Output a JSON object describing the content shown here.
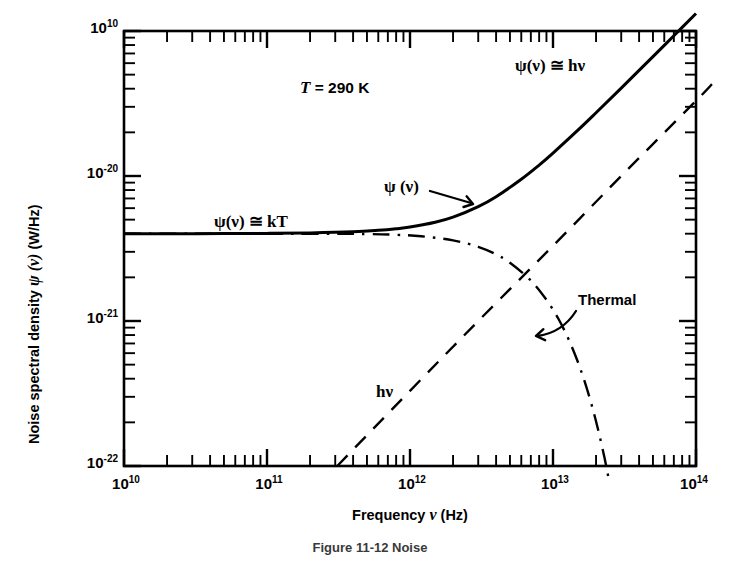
{
  "figure": {
    "caption": "Figure 11-12   Noise is the fewer-... and ...",
    "caption_visible_fragment": "Figure 11-12   Noise"
  },
  "chart_data": {
    "type": "line",
    "title": "",
    "xlabel_text": "Frequency ",
    "xlabel_symbol": "ν",
    "xlabel_units": " (Hz)",
    "ylabel_text": "Noise spectral density ",
    "ylabel_symbol": "ψ (ν)",
    "ylabel_units": " (W/Hz)",
    "xscale": "log",
    "yscale": "log",
    "xlim": [
      10000000000.0,
      100000000000000.0
    ],
    "ylim": [
      1e-22,
      1e-19
    ],
    "xticks": [
      "10^10",
      "10^11",
      "10^12",
      "10^13",
      "10^14"
    ],
    "xtick_mantissas": [
      1,
      10,
      11,
      12,
      13,
      14
    ],
    "yticks": [
      "10^-19",
      "10^-20",
      "10^-21",
      "10^-22"
    ],
    "grid": false,
    "legend": "none",
    "ytick_labels": [
      {
        "mantissa": "10",
        "exponent": "10",
        "value": 1e-19
      },
      {
        "mantissa": "10",
        "exponent": "-20",
        "value": 1e-20
      },
      {
        "mantissa": "10",
        "exponent": "-21",
        "value": 1e-21
      },
      {
        "mantissa": "10",
        "exponent": "-22",
        "value": 1e-22
      }
    ],
    "xtick_labels": [
      {
        "mantissa": "10",
        "exponent": "10",
        "value": 10000000000.0
      },
      {
        "mantissa": "10",
        "exponent": "11",
        "value": 100000000000.0
      },
      {
        "mantissa": "10",
        "exponent": "12",
        "value": 1000000000000.0
      },
      {
        "mantissa": "10",
        "exponent": "13",
        "value": 10000000000000.0
      },
      {
        "mantissa": "10",
        "exponent": "14",
        "value": 100000000000000.0
      }
    ],
    "physics": {
      "temperature_K": 290,
      "kT_W_per_Hz": 4e-21,
      "h_Js": 6.626e-34
    },
    "series": [
      {
        "name": "psi(nu) total",
        "style": "solid",
        "linewidth": 3.0,
        "description": "Total noise spectral density: flat at kT at low frequency, rising as h*nu at high frequency",
        "points": [
          [
            10000000000.0,
            4e-21
          ],
          [
            20000000000.0,
            4e-21
          ],
          [
            50000000000.0,
            4.01e-21
          ],
          [
            100000000000.0,
            4.02e-21
          ],
          [
            200000000000.0,
            4.05e-21
          ],
          [
            400000000000.0,
            4.12e-21
          ],
          [
            600000000000.0,
            4.22e-21
          ],
          [
            800000000000.0,
            4.33e-21
          ],
          [
            1000000000000.0,
            4.45e-21
          ],
          [
            1500000000000.0,
            4.8e-21
          ],
          [
            2000000000000.0,
            5.2e-21
          ],
          [
            3000000000000.0,
            6.15e-21
          ],
          [
            4000000000000.0,
            7.2e-21
          ],
          [
            6000000000000.0,
            9.5e-21
          ],
          [
            8000000000000.0,
            1.19e-20
          ],
          [
            10000000000000.0,
            1.44e-20
          ],
          [
            15000000000000.0,
            2.08e-20
          ],
          [
            20000000000000.0,
            2.73e-20
          ],
          [
            30000000000000.0,
            4.04e-20
          ],
          [
            50000000000000.0,
            6.65e-20
          ],
          [
            70000000000000.0,
            9.28e-20
          ],
          [
            100000000000000.0,
            1.32e-19
          ]
        ]
      },
      {
        "name": "h nu",
        "style": "dashed",
        "linewidth": 2.4,
        "description": "Quantum (zero-point / photon) term proportional to h*nu",
        "points": [
          [
            310000000000.0,
            1e-22
          ],
          [
            1000000000000.0,
            3.3e-22
          ],
          [
            3000000000000.0,
            1e-21
          ],
          [
            10000000000000.0,
            3.3e-21
          ],
          [
            30000000000000.0,
            1e-20
          ],
          [
            100000000000000.0,
            3.3e-20
          ],
          [
            132000000000000.0,
            4.4e-20
          ]
        ]
      },
      {
        "name": "Thermal",
        "style": "dashdot",
        "linewidth": 2.4,
        "description": "Thermal (Planck) term: flat at kT then rolling off exponentially above kT/h",
        "points": [
          [
            10000000000.0,
            4e-21
          ],
          [
            200000000000.0,
            4e-21
          ],
          [
            500000000000.0,
            3.98e-21
          ],
          [
            800000000000.0,
            3.93e-21
          ],
          [
            1200000000000.0,
            3.84e-21
          ],
          [
            2000000000000.0,
            3.6e-21
          ],
          [
            3000000000000.0,
            3.25e-21
          ],
          [
            4000000000000.0,
            2.88e-21
          ],
          [
            5000000000000.0,
            2.52e-21
          ],
          [
            7000000000000.0,
            1.9e-21
          ],
          [
            9000000000000.0,
            1.4e-21
          ],
          [
            11000000000000.0,
            1.02e-21
          ],
          [
            13000000000000.0,
            7.3e-22
          ],
          [
            15000000000000.0,
            5.15e-22
          ],
          [
            17000000000000.0,
            3.58e-22
          ],
          [
            19000000000000.0,
            2.46e-22
          ],
          [
            21000000000000.0,
            1.67e-22
          ],
          [
            23000000000000.0,
            1.12e-22
          ],
          [
            24500000000000.0,
            8.2e-23
          ]
        ]
      }
    ],
    "annotations": [
      {
        "name": "temperature",
        "text_prefix": "T",
        "text_suffix": " = 290 K",
        "x": 190000000000.0,
        "y": 4.1e-20
      },
      {
        "name": "psi-approx-kT",
        "text": "ψ(ν) ≅ kT",
        "x": 40000000000.0,
        "y": 6.2e-21
      },
      {
        "name": "psi-approx-hnu",
        "text": "ψ(ν) ≅ hν",
        "x": 11000000000000.0,
        "y": 1.25e-19
      },
      {
        "name": "psi-curve-label",
        "text": "ψ (ν)",
        "x": 1300000000000.0,
        "y": 1.05e-20
      },
      {
        "name": "hnu-curve-label",
        "text": "hν",
        "x": 2100000000000.0,
        "y": 3.4e-22
      },
      {
        "name": "thermal-curve-label",
        "text": "Thermal",
        "x": 20000000000000.0,
        "y": 1.05e-21
      }
    ]
  },
  "labels": {
    "temp_T": "T",
    "temp_rest": " = 290 K",
    "psi_kT": "ψ(ν) ≅ kT",
    "psi_hnu": "ψ(ν) ≅ hν",
    "psi_curve": "ψ (ν)",
    "hnu_curve": "hν",
    "thermal_curve": "Thermal",
    "xaxis_pre": "Frequency ",
    "xaxis_sym": "ν",
    "xaxis_post": " (Hz)",
    "yaxis_pre": "Noise spectral density ",
    "yaxis_sym": "ψ (ν)",
    "yaxis_post": " (W/Hz)"
  },
  "ytick_text": {
    "t0_m": "10",
    "t0_e": "10",
    "t1_m": "10",
    "t1_e": "-20",
    "t2_m": "10",
    "t2_e": "-21",
    "t3_m": "10",
    "t3_e": "-22"
  },
  "xtick_text": {
    "t0_m": "10",
    "t0_e": "10",
    "t1_m": "10",
    "t1_e": "11",
    "t2_m": "10",
    "t2_e": "12",
    "t3_m": "10",
    "t3_e": "13",
    "t4_m": "10",
    "t4_e": "14"
  },
  "colors": {
    "ink": "#000000",
    "background": "#ffffff",
    "caption_ink": "#3a3a3a"
  }
}
